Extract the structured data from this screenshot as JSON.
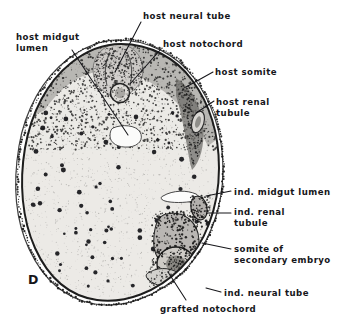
{
  "figure": {
    "panel_letter": "D",
    "kind": "histological-cross-section-photomicrograph"
  },
  "labels": [
    {
      "name": "host-midgut-lumen",
      "text": "host midgut\nlumen",
      "x": 16,
      "y": 32,
      "align": "left"
    },
    {
      "name": "host-neural-tube",
      "text": "host neural tube",
      "x": 143,
      "y": 11,
      "align": "left"
    },
    {
      "name": "host-notochord",
      "text": "host notochord",
      "x": 163,
      "y": 39,
      "align": "left"
    },
    {
      "name": "host-somite",
      "text": "host somite",
      "x": 215,
      "y": 67,
      "align": "left"
    },
    {
      "name": "host-renal-tubule",
      "text": "host renal\ntubule",
      "x": 216,
      "y": 97,
      "align": "left"
    },
    {
      "name": "ind-midgut-lumen",
      "text": "ind. midgut lumen",
      "x": 234,
      "y": 187,
      "align": "left"
    },
    {
      "name": "ind-renal-tubule",
      "text": "ind. renal\ntubule",
      "x": 234,
      "y": 207,
      "align": "left"
    },
    {
      "name": "somite-of-secondary-embryo",
      "text": "somite of\nsecondary embryo",
      "x": 234,
      "y": 244,
      "align": "left"
    },
    {
      "name": "ind-neural-tube",
      "text": "ind. neural tube",
      "x": 224,
      "y": 288,
      "align": "left"
    },
    {
      "name": "grafted-notochord",
      "text": "grafted notochord",
      "x": 160,
      "y": 304,
      "align": "left"
    }
  ],
  "leaders": [
    {
      "name": "leader-host-midgut-lumen",
      "points": "72,50 128,135"
    },
    {
      "name": "leader-host-neural-tube",
      "points": "141,22 115,72"
    },
    {
      "name": "leader-host-notochord",
      "points": "161,49 130,84"
    },
    {
      "name": "leader-host-somite",
      "points": "213,72 186,87"
    },
    {
      "name": "leader-host-renal-tubule",
      "points": "214,101 196,113"
    },
    {
      "name": "leader-ind-midgut-lumen",
      "points": "231,191 206,196"
    },
    {
      "name": "leader-ind-renal-tubule",
      "points": "231,213 208,213"
    },
    {
      "name": "leader-somite-secondary",
      "points": "231,249 202,243"
    },
    {
      "name": "leader-ind-neural-tube",
      "points": "221,292 206,288"
    },
    {
      "name": "leader-grafted-notochord",
      "points": "186,300 168,272"
    }
  ],
  "structures": [
    {
      "name": "section-outline",
      "description": "ovoid embryo cross-section, apex uppermost"
    },
    {
      "name": "host-neural-tube-body",
      "description": "dark elongated tube at dorsal apex"
    },
    {
      "name": "host-notochord-body",
      "description": "small round chorda below neural tube"
    },
    {
      "name": "host-midgut-lumen-cavity",
      "description": "pale archenteron cavity mid-dorsal"
    },
    {
      "name": "host-somite-mass",
      "description": "dark paraxial mesoderm block, right flank"
    },
    {
      "name": "host-renal-tubule-body",
      "description": "pronephric tubule, right flank"
    },
    {
      "name": "ind-midgut-lumen-cavity",
      "description": "induced pale gut slit, ventral right"
    },
    {
      "name": "ind-renal-tubule-body",
      "description": "induced pronephric tubule"
    },
    {
      "name": "secondary-somite-mass",
      "description": "somite of secondary embryo"
    },
    {
      "name": "ind-neural-tube-body",
      "description": "induced neural tube ring, ventral"
    },
    {
      "name": "grafted-notochord-body",
      "description": "grafted chorda, ventral margin"
    },
    {
      "name": "epidermis-border",
      "description": "dark ectodermal rim around section"
    },
    {
      "name": "pigment-layer",
      "description": "dense pigment granule band beneath epidermis"
    },
    {
      "name": "yolk-endoderm-field",
      "description": "pale stippled yolk mass with dark nuclei"
    }
  ],
  "colors": {
    "background": "#ffffff",
    "ink": "#16161a",
    "tissue_pale": "#e9e9e6",
    "tissue_mid": "#b7b7b2",
    "tissue_dark": "#3a3a3a"
  }
}
